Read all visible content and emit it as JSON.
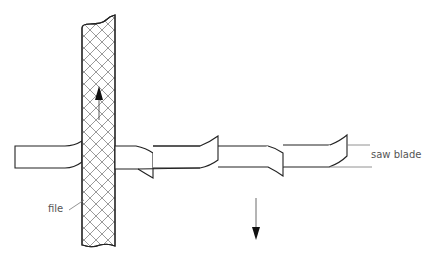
{
  "diagram": {
    "labels": {
      "saw_blade": "saw blade",
      "file": "file"
    },
    "colors": {
      "line": "#222222",
      "hatch": "#555555",
      "leader": "#777777",
      "background": "#ffffff"
    },
    "arrows": {
      "file_motion": "up",
      "blade_motion": "down"
    }
  }
}
